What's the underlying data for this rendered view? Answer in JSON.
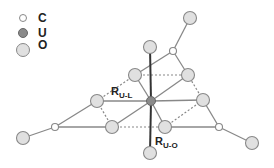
{
  "legend": [
    {
      "symbol": "carbon-atom",
      "label": "C"
    },
    {
      "symbol": "uranium-atom",
      "label": "U"
    },
    {
      "symbol": "oxygen-atom",
      "label": "O"
    }
  ],
  "labels": {
    "r_ul": {
      "main": "R",
      "sub": "U-L"
    },
    "r_uo": {
      "main": "R",
      "sub": "U-O"
    }
  },
  "colors": {
    "oxygen_fill": "#e0e0e0",
    "uranium_fill": "#8a8a8a",
    "carbon_fill": "#ffffff",
    "stroke": "#7a7a7a",
    "axial_bond": "#333333"
  }
}
